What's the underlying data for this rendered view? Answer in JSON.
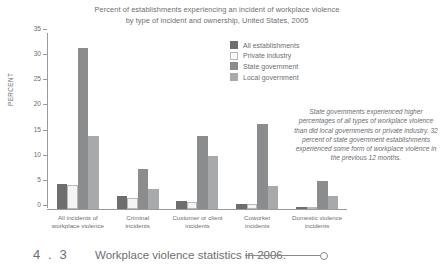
{
  "chart_data": {
    "type": "bar",
    "title": "Percent of establishments experiencing an incident of workplace violence by type of incident and ownership, United States, 2005",
    "title_line1": "Percent of establishments experiencing an incident of workplace violence",
    "title_line2": "by type of incident and ownership, United States, 2005",
    "xlabel": "",
    "ylabel": "PERCENT",
    "ylim": [
      0,
      35
    ],
    "yticks": [
      0,
      5,
      10,
      15,
      20,
      25,
      30,
      35
    ],
    "grid": false,
    "legend_position": "upper-center-right",
    "categories": [
      "All incidents of workplace violence",
      "Criminal incidents",
      "Customer or client incidents",
      "Coworker incidents",
      "Domestic violence incidents"
    ],
    "category_lines": [
      [
        "All incidents of",
        "workplace violence"
      ],
      [
        "Criminal",
        "incidents"
      ],
      [
        "Customer or client",
        "incidents"
      ],
      [
        "Coworker",
        "incidents"
      ],
      [
        "Domestic violence",
        "incidents"
      ]
    ],
    "series": [
      {
        "name": "All establishments",
        "color": "#6d6e70",
        "values": [
          5.0,
          2.5,
          1.5,
          1.0,
          0.5
        ]
      },
      {
        "name": "Private industry",
        "color": "#fafafa",
        "values": [
          4.8,
          2.2,
          1.4,
          0.9,
          0.5
        ]
      },
      {
        "name": "State government",
        "color": "#8b8c8e",
        "values": [
          32.0,
          8.0,
          14.5,
          17.0,
          5.5
        ]
      },
      {
        "name": "Local government",
        "color": "#a8a9ab",
        "values": [
          14.5,
          4.0,
          10.5,
          4.5,
          2.5
        ]
      }
    ],
    "annotation": "State governments experienced higher percentages of all types of workplace violence than did local governments or private industry. 32 percent of state government establishments experienced some form of workplace violence in the previous 12 months."
  },
  "caption": {
    "number": "4 . 3",
    "text": "Workplace violence statistics in 2006."
  }
}
